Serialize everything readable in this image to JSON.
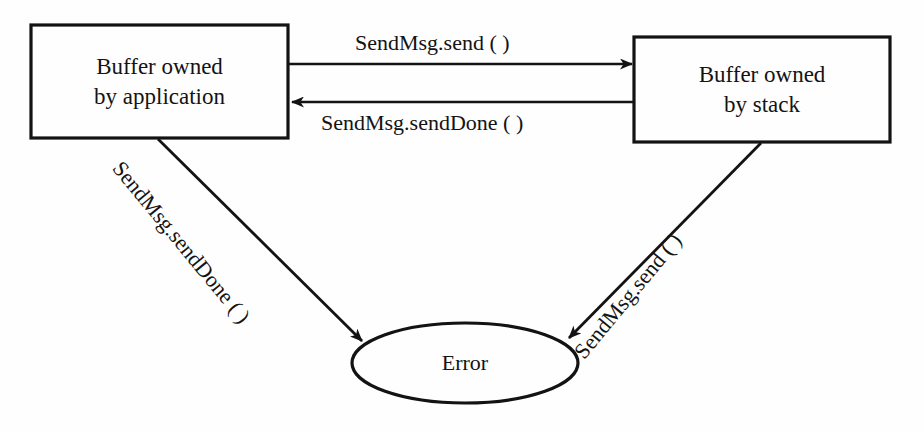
{
  "diagram": {
    "background_color": "#fefefe",
    "stroke_color": "#131313",
    "nodes": [
      {
        "id": "buffer-owned-by-application",
        "shape": "rectangle",
        "line1": "Buffer owned",
        "line2": "by application"
      },
      {
        "id": "buffer-owned-by-stack",
        "shape": "rectangle",
        "line1": "Buffer owned",
        "line2": "by stack"
      },
      {
        "id": "error",
        "shape": "ellipse",
        "line1": "Error"
      }
    ],
    "edges": [
      {
        "id": "app-to-stack",
        "from": "buffer-owned-by-application",
        "to": "buffer-owned-by-stack",
        "label": "SendMsg.send ( )",
        "direction": "right"
      },
      {
        "id": "stack-to-app",
        "from": "buffer-owned-by-stack",
        "to": "buffer-owned-by-application",
        "label": "SendMsg.sendDone ( )",
        "direction": "left"
      },
      {
        "id": "app-to-error",
        "from": "buffer-owned-by-application",
        "to": "error",
        "label": "SendMsg.sendDone ( )",
        "direction": "down-right"
      },
      {
        "id": "stack-to-error",
        "from": "buffer-owned-by-stack",
        "to": "error",
        "label": "SendMsg.send ( )",
        "direction": "down-left"
      }
    ]
  }
}
